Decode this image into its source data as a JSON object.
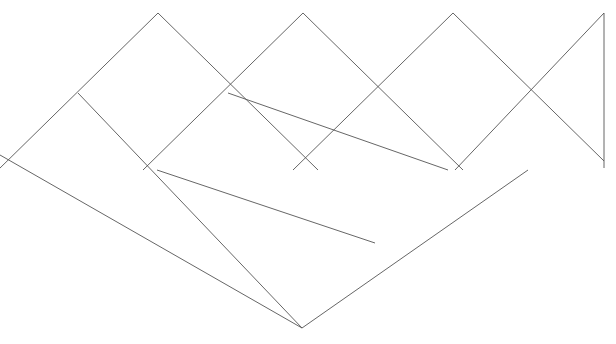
{
  "figure": {
    "canvas": {
      "width": 616,
      "height": 344,
      "background_color": "#ffffff"
    },
    "style": {
      "stroke_color": "#555555",
      "stroke_width": 0.9,
      "fill": "none"
    },
    "geometry": {
      "description": "Zigzag diagonal lattice forming a row of diamonds with crossing extensions and one vertical closing segment at the right edge",
      "peak_y": 13,
      "mid_y": 170,
      "bottom_y": 328,
      "peaks_x": [
        158,
        303,
        453
      ],
      "vertical_x": 604
    },
    "segments": [
      {
        "name": "upper-zigzag-down-1",
        "x1": 0,
        "y1": 13,
        "x2": 0,
        "y2": 13
      },
      {
        "name": "rising-edge-1",
        "x1": -2,
        "y1": 170,
        "x2": 158,
        "y2": 13
      },
      {
        "name": "falling-edge-1",
        "x1": 158,
        "y1": 13,
        "x2": 318,
        "y2": 170
      },
      {
        "name": "rising-edge-2",
        "x1": 143,
        "y1": 170,
        "x2": 303,
        "y2": 13
      },
      {
        "name": "falling-edge-2",
        "x1": 303,
        "y1": 13,
        "x2": 463,
        "y2": 170
      },
      {
        "name": "rising-edge-3",
        "x1": 293,
        "y1": 170,
        "x2": 453,
        "y2": 13
      },
      {
        "name": "falling-edge-3",
        "x1": 453,
        "y1": 13,
        "x2": 604,
        "y2": 161
      },
      {
        "name": "rising-edge-4",
        "x1": 455,
        "y1": 170,
        "x2": 604,
        "y2": 13
      },
      {
        "name": "vertical-right-edge",
        "x1": 604,
        "y1": 13,
        "x2": 604,
        "y2": 168
      },
      {
        "name": "descending-long-left",
        "x1": 0,
        "y1": 155,
        "x2": 302,
        "y2": 328
      },
      {
        "name": "lower-rising-edge-1",
        "x1": 157,
        "y1": 170,
        "x2": 375,
        "y2": 243
      },
      {
        "name": "lower-diamond-right",
        "x1": 302,
        "y1": 328,
        "x2": 528,
        "y2": 170
      },
      {
        "name": "lower-left-descend",
        "x1": 78,
        "y1": 93,
        "x2": 302,
        "y2": 328
      },
      {
        "name": "mid-descend-right",
        "x1": 228,
        "y1": 93,
        "x2": 448,
        "y2": 170
      }
    ],
    "vertices": [
      {
        "name": "peak-1",
        "x": 158,
        "y": 13
      },
      {
        "name": "peak-2",
        "x": 303,
        "y": 13
      },
      {
        "name": "peak-3",
        "x": 453,
        "y": 13
      },
      {
        "name": "vertical-top",
        "x": 604,
        "y": 13
      },
      {
        "name": "vertical-bottom",
        "x": 604,
        "y": 168
      },
      {
        "name": "cross-left",
        "x": 78,
        "y": 93
      },
      {
        "name": "cross-mid-left",
        "x": 228,
        "y": 93
      },
      {
        "name": "cross-mid-right",
        "x": 378,
        "y": 93
      },
      {
        "name": "cross-right",
        "x": 528,
        "y": 93
      },
      {
        "name": "node-mid-1",
        "x": 157,
        "y": 170
      },
      {
        "name": "node-mid-center",
        "x": 303,
        "y": 170
      },
      {
        "name": "node-mid-3",
        "x": 448,
        "y": 170
      },
      {
        "name": "node-lower",
        "x": 375,
        "y": 243
      },
      {
        "name": "bottom-apex",
        "x": 302,
        "y": 328
      }
    ]
  }
}
